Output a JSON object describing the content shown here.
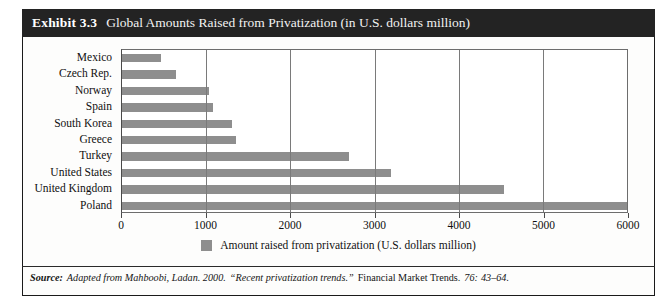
{
  "exhibit": {
    "number": "Exhibit 3.3",
    "title": "Global Amounts Raised from Privatization (in U.S. dollars million)"
  },
  "legend": {
    "label": "Amount raised from privatization (U.S. dollars million)",
    "swatch_color": "#8e8e8e"
  },
  "source": {
    "prefix": "Source:",
    "authors": "Adapted from Mahboobi, Ladan. 2000.",
    "article": "“Recent privatization trends.”",
    "journal": "Financial Market Trends.",
    "volume": "76:",
    "pages": "43–64."
  },
  "colors": {
    "title_bar": "#232323",
    "bar": "#8e8e8e",
    "gridline": "#7a7a7a",
    "frame": "#1a1a1a"
  },
  "chart_data": {
    "type": "bar",
    "orientation": "horizontal",
    "title": "Global Amounts Raised from Privatization (in U.S. dollars million)",
    "xlabel": "",
    "ylabel": "",
    "xlim": [
      0,
      6000
    ],
    "xticks": [
      0,
      1000,
      2000,
      3000,
      4000,
      5000,
      6000
    ],
    "xtick_labels": [
      "0",
      "1000",
      "2000",
      "3000",
      "4000",
      "5000",
      "6000"
    ],
    "grid": true,
    "legend_position": "bottom-center",
    "categories": [
      "Mexico",
      "Czech Rep.",
      "Norway",
      "Spain",
      "South Korea",
      "Greece",
      "Turkey",
      "United States",
      "United Kingdom",
      "Poland"
    ],
    "series": [
      {
        "name": "Amount raised from privatization (U.S. dollars million)",
        "values": [
          460,
          640,
          1030,
          1080,
          1310,
          1360,
          2700,
          3200,
          4540,
          6000
        ]
      }
    ]
  }
}
